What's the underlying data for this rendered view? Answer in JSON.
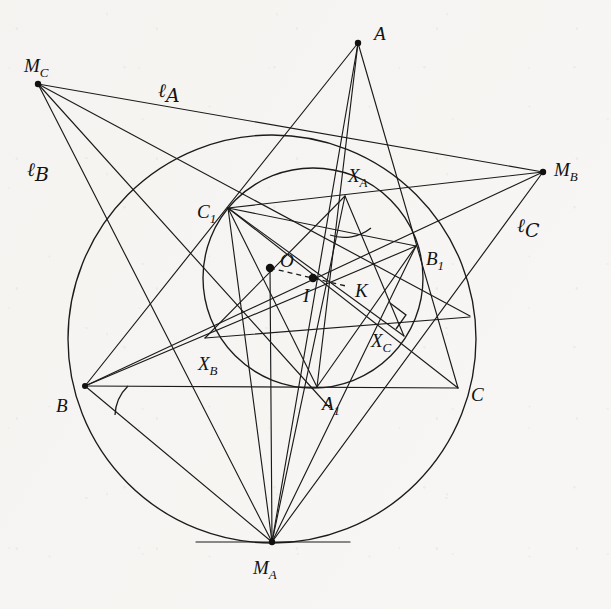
{
  "figure": {
    "kind": "euclidean-geometry-diagram",
    "background_color": "#f7f6f4",
    "ink_color": "#1b1b1b",
    "caption": "",
    "labels": {
      "A": {
        "text": "A",
        "sub": ""
      },
      "B": {
        "text": "B",
        "sub": ""
      },
      "C": {
        "text": "C",
        "sub": ""
      },
      "A1": {
        "text": "A",
        "sub": "1"
      },
      "B1": {
        "text": "B",
        "sub": "1"
      },
      "C1": {
        "text": "C",
        "sub": "1"
      },
      "XA": {
        "text": "X",
        "sub": "A"
      },
      "XB": {
        "text": "X",
        "sub": "B"
      },
      "XC": {
        "text": "X",
        "sub": "C"
      },
      "MA": {
        "text": "M",
        "sub": "A"
      },
      "MB": {
        "text": "M",
        "sub": "B"
      },
      "MC": {
        "text": "M",
        "sub": "C"
      },
      "O": {
        "text": "O",
        "sub": ""
      },
      "I": {
        "text": "I",
        "sub": ""
      },
      "K": {
        "text": "K",
        "sub": ""
      },
      "lA": {
        "text": "ℓ",
        "sub": "A"
      },
      "lB": {
        "text": "ℓ",
        "sub": "B"
      },
      "lC": {
        "text": "ℓ",
        "sub": "C"
      }
    },
    "points": {
      "A": {
        "x": 358,
        "y": 43,
        "marked": false
      },
      "B": {
        "x": 85,
        "y": 386,
        "marked": false
      },
      "C": {
        "x": 458,
        "y": 388,
        "marked": false
      },
      "A1": {
        "x": 317,
        "y": 387,
        "marked": false
      },
      "B1": {
        "x": 416,
        "y": 246,
        "marked": false
      },
      "C1": {
        "x": 228,
        "y": 208,
        "marked": false
      },
      "XA": {
        "x": 345,
        "y": 196,
        "marked": false
      },
      "XB": {
        "x": 240,
        "y": 344,
        "marked": false
      },
      "XC": {
        "x": 386,
        "y": 322,
        "marked": false
      },
      "MA": {
        "x": 272,
        "y": 542,
        "marked": false
      },
      "MB": {
        "x": 543,
        "y": 172,
        "marked": false
      },
      "MC": {
        "x": 38,
        "y": 84,
        "marked": false
      },
      "O": {
        "x": 270,
        "y": 268,
        "marked": true
      },
      "I": {
        "x": 313,
        "y": 278,
        "marked": true
      },
      "K": {
        "x": 346,
        "y": 286,
        "marked": false
      }
    },
    "label_positions": {
      "A": {
        "x": 374,
        "y": 40
      },
      "B": {
        "x": 63,
        "y": 409
      },
      "C": {
        "x": 474,
        "y": 399
      },
      "A1": {
        "x": 325,
        "y": 408
      },
      "B1": {
        "x": 429,
        "y": 263
      },
      "C1": {
        "x": 202,
        "y": 215
      },
      "XA": {
        "x": 354,
        "y": 180
      },
      "XB": {
        "x": 203,
        "y": 368
      },
      "XC": {
        "x": 376,
        "y": 345
      },
      "MA": {
        "x": 258,
        "y": 571
      },
      "MB": {
        "x": 556,
        "y": 172
      },
      "MC": {
        "x": 25,
        "y": 70
      },
      "O": {
        "x": 282,
        "y": 266
      },
      "I": {
        "x": 306,
        "y": 298
      },
      "K": {
        "x": 358,
        "y": 295
      },
      "lA": {
        "x": 162,
        "y": 94
      },
      "lB": {
        "x": 32,
        "y": 173
      },
      "lC": {
        "x": 521,
        "y": 229
      }
    },
    "circles": [
      {
        "name": "circumcircle",
        "cx": 272,
        "cy": 339,
        "r": 204
      },
      {
        "name": "incircle",
        "cx": 313,
        "cy": 278,
        "r": 110
      }
    ],
    "segments": [
      {
        "name": "side-AB",
        "from": "A",
        "to": "B"
      },
      {
        "name": "side-AC",
        "from": "A",
        "to": "C"
      },
      {
        "name": "side-BC",
        "from": "B",
        "to": "C"
      },
      {
        "name": "cevian-A-A1",
        "from": "A",
        "to": "A1"
      },
      {
        "name": "chord-B-B1",
        "from": "B",
        "to": "B1"
      },
      {
        "name": "chord-C-C1",
        "from": "C",
        "to": "C1"
      },
      {
        "name": "chord-A1-C1",
        "from": "A1",
        "to": "C1"
      },
      {
        "name": "chord-A1-B1",
        "from": "A1",
        "to": "B1"
      },
      {
        "name": "chord-B1-C1",
        "from": "B1",
        "to": "C1"
      },
      {
        "name": "tangent-line-lA",
        "from": "MC",
        "to": "MB"
      },
      {
        "name": "tangent-line-lB",
        "from": "MC",
        "to": "MA"
      },
      {
        "name": "tangent-line-lC",
        "from": "MB",
        "to": "MA"
      },
      {
        "name": "ray-MC-B1",
        "from": "MC",
        "to": "B1"
      },
      {
        "name": "ray-MB-B",
        "from": "MB",
        "to": "B"
      },
      {
        "name": "ray-MA-C1",
        "from": "MA",
        "to": "C1"
      },
      {
        "name": "ray-MA-B",
        "from": "MA",
        "to": "B"
      },
      {
        "name": "ray-MA-A",
        "from": "MA",
        "to": "A"
      },
      {
        "name": "ray-MA-B1",
        "from": "MA",
        "to": "B1"
      },
      {
        "name": "radius-O-MA",
        "from": "O",
        "to": "MA"
      },
      {
        "name": "line-OIK",
        "from": "O",
        "to": "K",
        "style": "dashed"
      },
      {
        "name": "chord-XA-XB",
        "from": "XA",
        "to": "XB"
      },
      {
        "name": "chord-XA-XC",
        "from": "XA",
        "to": "XC"
      }
    ],
    "angle_marks": [
      {
        "name": "angle-at-B",
        "vertex": "B"
      },
      {
        "name": "angle-at-XA",
        "vertex": "XA"
      },
      {
        "name": "right-angle-at-XC",
        "vertex": "XC"
      }
    ],
    "tangent_segment_at_MA": {
      "x1": 196,
      "y1": 542,
      "x2": 350,
      "y2": 542
    }
  }
}
